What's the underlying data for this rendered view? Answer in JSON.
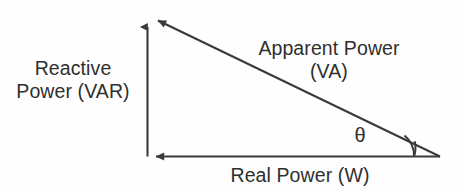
{
  "diagram": {
    "type": "power-triangle",
    "background_color": "#fefefe",
    "stroke_color": "#3a3a3a",
    "text_color": "#2f2f2f",
    "labels": {
      "reactive_power": {
        "line1": "Reactive",
        "line2": "Power (VAR)",
        "axis": "vertical",
        "unit": "VAR"
      },
      "apparent_power": {
        "line1": "Apparent Power",
        "line2": "(VA)",
        "axis": "hypotenuse",
        "unit": "VA"
      },
      "real_power": {
        "line1": "Real Power (W)",
        "axis": "horizontal",
        "unit": "W"
      },
      "angle": {
        "symbol": "θ",
        "name": "phase-angle"
      }
    }
  },
  "geometry": {
    "apex": {
      "x": 148,
      "y": 18
    },
    "origin": {
      "x": 147.5,
      "y": 156.5
    },
    "right_vertex": {
      "x": 440,
      "y": 156.5
    },
    "arc_radius": 26
  }
}
